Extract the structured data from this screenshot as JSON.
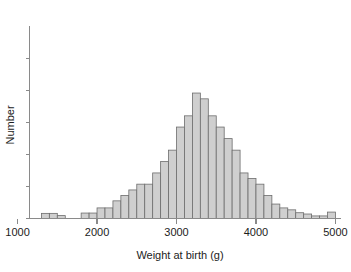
{
  "chart_data": {
    "type": "bar",
    "title": "",
    "subtitle": "",
    "xlabel": "Weight at birth (g)",
    "ylabel": "Number",
    "xlim": [
      1150,
      5070
    ],
    "ylim": [
      0,
      6
    ],
    "grid": false,
    "legend": null,
    "bin_width": 100,
    "xticks": [
      1000,
      2000,
      3000,
      4000,
      5000
    ],
    "xtick_labels": [
      "1000",
      "2000",
      "3000",
      "4000",
      "5000"
    ],
    "yticks": [
      0,
      1,
      2,
      3,
      4,
      5
    ],
    "ytick_labels": [
      "",
      "",
      "",
      "",
      "",
      ""
    ],
    "categories": [
      "1300",
      "1400",
      "1500",
      "1800",
      "1900",
      "2000",
      "2100",
      "2200",
      "2300",
      "2400",
      "2500",
      "2600",
      "2700",
      "2800",
      "2900",
      "3000",
      "3100",
      "3200",
      "3300",
      "3400",
      "3500",
      "3600",
      "3700",
      "3800",
      "3900",
      "4000",
      "4100",
      "4200",
      "4300",
      "4400",
      "4500",
      "4600",
      "4700",
      "4800",
      "4900"
    ],
    "values": [
      0.16,
      0.16,
      0.09,
      0.17,
      0.17,
      0.33,
      0.33,
      0.55,
      0.72,
      0.89,
      1.07,
      1.07,
      1.42,
      1.78,
      2.13,
      2.85,
      3.2,
      3.91,
      3.73,
      3.2,
      2.85,
      2.49,
      2.13,
      1.42,
      1.25,
      1.07,
      0.72,
      0.45,
      0.33,
      0.27,
      0.18,
      0.14,
      0.08,
      0.08,
      0.2
    ],
    "bin_starts": [
      1300,
      1400,
      1500,
      1800,
      1900,
      2000,
      2100,
      2200,
      2300,
      2400,
      2500,
      2600,
      2700,
      2800,
      2900,
      3000,
      3100,
      3200,
      3300,
      3400,
      3500,
      3600,
      3700,
      3800,
      3900,
      4000,
      4100,
      4200,
      4300,
      4400,
      4500,
      4600,
      4700,
      4800,
      4900
    ],
    "colors": {
      "bar_fill": "#cfcfcf",
      "bar_edge": "#6d6d6d",
      "axis": "#8a8a8a",
      "text": "#1c1c1c",
      "background": "#ffffff"
    }
  }
}
